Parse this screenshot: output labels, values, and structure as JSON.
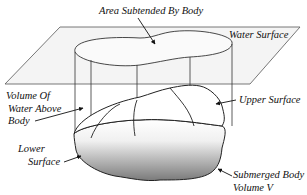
{
  "diagram": {
    "labels": {
      "area_subtended": "Area Subtended By Body",
      "water_surface": "Water Surface",
      "volume_above_line1": "Volume Of",
      "volume_above_line2": "Water Above",
      "volume_above_line3": "Body",
      "upper_surface": "Upper Surface",
      "lower_surface_line1": "Lower",
      "lower_surface_line2": "Surface",
      "submerged_line1": "Submerged Body",
      "submerged_line2": "Volume V"
    },
    "colors": {
      "plane_fill": "#f4f4f4",
      "stroke": "#222222",
      "shade_dark": "#8a8a8a",
      "shade_light": "#ffffff"
    }
  }
}
